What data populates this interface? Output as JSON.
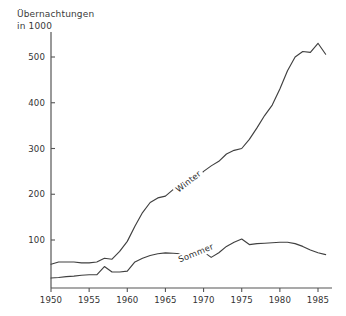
{
  "chart_data": {
    "type": "line",
    "title": "Übernachtungen\nin 1000",
    "title_line1": "Übernachtungen",
    "title_line2": "in 1000",
    "xlabel": "",
    "ylabel": "Übernachtungen in 1000",
    "xlim": [
      1950,
      1986
    ],
    "ylim": [
      0,
      545
    ],
    "grid": false,
    "legend_position": "inline-on-curve",
    "x_ticks": [
      1950,
      1955,
      1960,
      1965,
      1970,
      1975,
      1980,
      1985
    ],
    "x_tick_labels": [
      "1950",
      "1955",
      "1960",
      "1965",
      "1970",
      "1975",
      "1980",
      "1985"
    ],
    "y_ticks": [
      100,
      200,
      300,
      400,
      500
    ],
    "y_tick_labels": [
      "100",
      "200",
      "300",
      "400",
      "500"
    ],
    "x": [
      1950,
      1951,
      1952,
      1953,
      1954,
      1955,
      1956,
      1957,
      1958,
      1959,
      1960,
      1961,
      1962,
      1963,
      1964,
      1965,
      1966,
      1967,
      1968,
      1969,
      1970,
      1971,
      1972,
      1973,
      1974,
      1975,
      1976,
      1977,
      1978,
      1979,
      1980,
      1981,
      1982,
      1983,
      1984,
      1985,
      1986
    ],
    "series": [
      {
        "name": "Winter",
        "label": "Winter",
        "color": "#404040",
        "values": [
          47,
          52,
          52,
          52,
          50,
          50,
          52,
          60,
          58,
          75,
          97,
          130,
          160,
          182,
          192,
          196,
          210,
          222,
          228,
          232,
          250,
          262,
          272,
          288,
          296,
          300,
          320,
          345,
          372,
          395,
          430,
          470,
          500,
          512,
          510,
          530,
          506
        ],
        "annotation": {
          "text": "Winter",
          "x_position": 1968,
          "rotated": true,
          "rotation_deg": -38
        }
      },
      {
        "name": "Sommer",
        "label": "Sommer",
        "color": "#404040",
        "values": [
          17,
          18,
          20,
          21,
          23,
          24,
          24,
          42,
          30,
          30,
          32,
          52,
          60,
          66,
          70,
          72,
          71,
          70,
          70,
          72,
          74,
          62,
          72,
          86,
          95,
          102,
          90,
          92,
          93,
          94,
          95,
          95,
          92,
          86,
          78,
          72,
          68
        ],
        "annotation": {
          "text": "Sommer",
          "x_position": 1969,
          "rotated": true,
          "rotation_deg": -22
        }
      }
    ]
  },
  "axis": {
    "title_line1": "Übernachtungen",
    "title_line2": "in 1000"
  }
}
